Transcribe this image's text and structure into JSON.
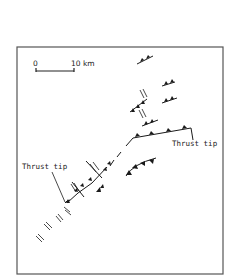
{
  "figure": {
    "type": "geologic fault map",
    "frame_color": "#555555",
    "line_color": "#1a1a1a"
  },
  "scale_bar": {
    "start_label": "0",
    "end_label": "10 km"
  },
  "labels": {
    "thrust_tip_left": "Thrust tip",
    "thrust_tip_right": "Thrust tip"
  },
  "symbols": {
    "thrust_fault": "line with filled triangular teeth",
    "strike_slip_arrows": "half-arrow pairs (sinistral/dextral offset)"
  }
}
